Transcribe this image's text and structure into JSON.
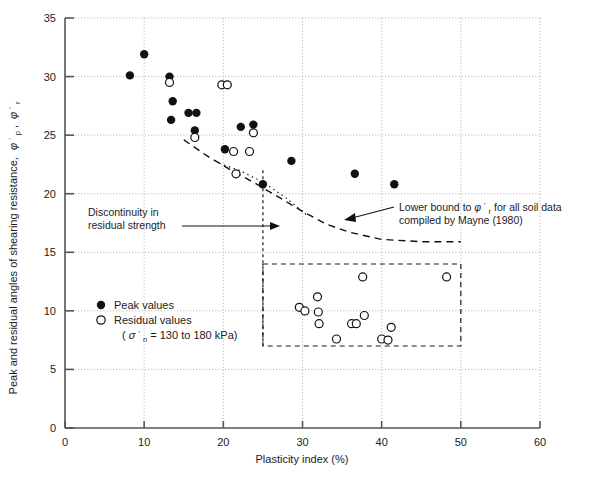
{
  "chart_data": {
    "type": "scatter",
    "title": "",
    "xlabel": "Plasticity index (%)",
    "ylabel": "Peak and residual angles of shearing resistance, φ'p, φ'r",
    "xlim": [
      0,
      60
    ],
    "ylim": [
      0,
      35
    ],
    "xticks": [
      0,
      10,
      20,
      30,
      40,
      50,
      60
    ],
    "yticks": [
      0,
      5,
      10,
      15,
      20,
      25,
      30,
      35
    ],
    "grid": true,
    "grid_style": "dotted",
    "legend_position": "inside-lower-left",
    "series": [
      {
        "name": "Peak values",
        "marker": "filled-circle",
        "color": "#111111",
        "points": [
          [
            8.2,
            30.1
          ],
          [
            10.0,
            31.9
          ],
          [
            13.2,
            30.0
          ],
          [
            13.6,
            27.9
          ],
          [
            13.4,
            26.3
          ],
          [
            15.6,
            26.9
          ],
          [
            16.6,
            26.9
          ],
          [
            16.4,
            25.4
          ],
          [
            20.2,
            23.8
          ],
          [
            22.2,
            25.7
          ],
          [
            23.8,
            25.9
          ],
          [
            25.0,
            20.8
          ],
          [
            28.6,
            22.8
          ],
          [
            36.6,
            21.7
          ],
          [
            41.6,
            20.8
          ]
        ]
      },
      {
        "name": "Residual values",
        "marker": "open-circle",
        "color": "#111111",
        "points": [
          [
            13.2,
            29.5
          ],
          [
            19.8,
            29.3
          ],
          [
            20.5,
            29.3
          ],
          [
            16.4,
            24.8
          ],
          [
            23.8,
            25.2
          ],
          [
            21.3,
            23.6
          ],
          [
            23.3,
            23.6
          ],
          [
            21.6,
            21.7
          ],
          [
            29.6,
            10.3
          ],
          [
            30.3,
            10.0
          ],
          [
            31.9,
            11.2
          ],
          [
            32.0,
            9.9
          ],
          [
            32.1,
            8.9
          ],
          [
            34.3,
            7.6
          ],
          [
            36.2,
            8.9
          ],
          [
            36.8,
            8.9
          ],
          [
            37.6,
            12.9
          ],
          [
            37.8,
            9.6
          ],
          [
            40.0,
            7.6
          ],
          [
            40.8,
            7.5
          ],
          [
            41.2,
            8.6
          ],
          [
            48.2,
            12.9
          ]
        ]
      }
    ],
    "annotations": [
      {
        "id": "discontinuity",
        "lines": [
          "Discontinuity in",
          "residual strength"
        ],
        "arrow_to": [
          25,
          17.6
        ]
      },
      {
        "id": "mayne-lower-bound",
        "lines": [
          "Lower bound to φ'r for all soil data",
          "compiled by Mayne (1980)"
        ],
        "arrow_to": [
          34.5,
          16.6
        ]
      }
    ],
    "curves": [
      {
        "id": "mayne-lower-bound-curve",
        "style": "dashed",
        "points": [
          [
            15.0,
            24.6
          ],
          [
            18.0,
            23.2
          ],
          [
            21.0,
            22.0
          ],
          [
            24.0,
            20.9
          ],
          [
            27.0,
            19.7
          ],
          [
            30.0,
            18.5
          ],
          [
            33.0,
            17.4
          ],
          [
            36.0,
            16.7
          ],
          [
            40.0,
            16.1
          ],
          [
            45.0,
            15.9
          ],
          [
            50.0,
            15.9
          ]
        ]
      },
      {
        "id": "discontinuity-curve",
        "style": "dotted",
        "points": [
          [
            19.5,
            22.6
          ],
          [
            22.0,
            22.0
          ],
          [
            25.0,
            21.0
          ],
          [
            28.0,
            19.6
          ],
          [
            30.5,
            18.2
          ]
        ]
      }
    ],
    "shapes": [
      {
        "id": "residual-band-box",
        "style": "dashed",
        "x_range": [
          25,
          50
        ],
        "y_range": [
          7,
          14
        ]
      },
      {
        "id": "discontinuity-vertical-line",
        "style": "dashed-vertical",
        "x": 25,
        "y_range": [
          7,
          22
        ]
      }
    ],
    "legend": {
      "entries": [
        {
          "marker": "filled-circle",
          "label": "Peak values"
        },
        {
          "marker": "open-circle",
          "label": "Residual values"
        }
      ],
      "note": "(σ'n = 130 to 180 kPa)",
      "note_parts": {
        "sigma": "σ",
        "prime": "'",
        "sub": "n",
        "rest": " = 130 to 180 kPa)"
      }
    }
  },
  "axis": {
    "x_tick_labels": [
      "0",
      "10",
      "20",
      "30",
      "40",
      "50",
      "60"
    ],
    "y_tick_labels": [
      "0",
      "5",
      "10",
      "15",
      "20",
      "25",
      "30",
      "35"
    ],
    "x_title": "Plasticity index (%)",
    "y_title_main": "Peak and residual angles of shearing resistance,",
    "y_title_sym1": "φ",
    "y_title_sub1": "p",
    "y_title_sym2": "φ",
    "y_title_sub2": "r",
    "y_title_comma": ","
  },
  "annotation_text": {
    "disc_line1": "Discontinuity in",
    "disc_line2": "residual strength",
    "mayne_line1_a": "Lower bound to ",
    "mayne_line1_sym": "φ",
    "mayne_line1_sub": "r",
    "mayne_line1_b": " for all soil data",
    "mayne_line2": "compiled by Mayne (1980)"
  },
  "legend_text": {
    "peak": "Peak values",
    "residual": "Residual values",
    "stress_sigma": "σ",
    "stress_sub": "n",
    "stress_rest": " = 130 to 180 kPa)",
    "paren_open": "("
  },
  "colors": {
    "axis": "#555555",
    "grid": "#9a9a9a",
    "marker": "#111111",
    "text": "#222222",
    "background": "#ffffff"
  }
}
